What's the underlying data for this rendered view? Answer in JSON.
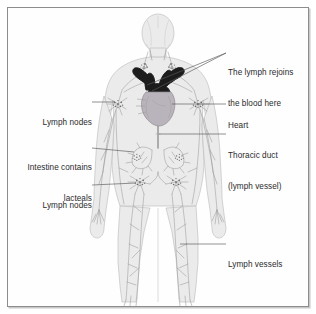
{
  "figure": {
    "colors": {
      "frame_border": "#8d8d8d",
      "frame_shadow": "#c8c8c8",
      "background": "#fefefe",
      "body_fill": "#ebebeb",
      "body_outline": "#b4b4b4",
      "vessel_line": "#9a9a9a",
      "node_dot": "#6e6e6e",
      "heart_body": "#b9b3bb",
      "heart_vessels": "#1c1c1c",
      "thoracic_duct": "#8a8a8a",
      "leader_line": "#585858",
      "label_text": "#2b2b2b"
    }
  },
  "labels": {
    "lymph_rejoins": {
      "line1": "The lymph rejoins",
      "line2": "the blood here",
      "side": "right"
    },
    "heart": {
      "line1": "Heart",
      "side": "right"
    },
    "thoracic_duct": {
      "line1": "Thoracic duct",
      "line2": "(lymph vessel)",
      "side": "right"
    },
    "lymph_vessels": {
      "line1": "Lymph vessels",
      "side": "right"
    },
    "lymph_nodes_upper": {
      "line1": "Lymph nodes",
      "side": "left"
    },
    "intestine_lacteals": {
      "line1": "Intestine contains",
      "line2": "lacteals",
      "side": "left"
    },
    "lymph_nodes_lower": {
      "line1": "Lymph nodes",
      "side": "left"
    }
  }
}
